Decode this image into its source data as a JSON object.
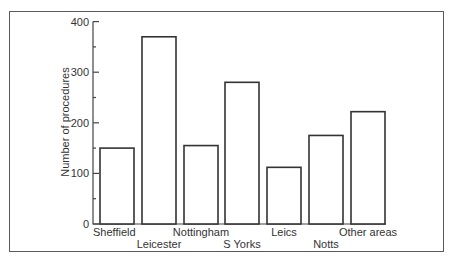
{
  "chart_data": {
    "type": "bar",
    "title": "",
    "xlabel": "",
    "ylabel": "Number of procedures",
    "ylim": [
      0,
      400
    ],
    "yticks": [
      0,
      100,
      200,
      300,
      400
    ],
    "grid": false,
    "legend": null,
    "categories": [
      "Sheffield",
      "Leicester",
      "Nottingham",
      "S Yorks",
      "Leics",
      "Notts",
      "Other areas"
    ],
    "values": [
      150,
      370,
      155,
      280,
      112,
      175,
      222
    ],
    "label_rows": [
      0,
      1,
      0,
      1,
      0,
      1,
      0
    ]
  },
  "labels": {
    "ylabel": "Number of procedures",
    "yticks": [
      "0",
      "100",
      "200",
      "300",
      "400"
    ],
    "categories": [
      "Sheffield",
      "Leicester",
      "Nottingham",
      "S Yorks",
      "Leics",
      "Notts",
      "Other areas"
    ]
  }
}
